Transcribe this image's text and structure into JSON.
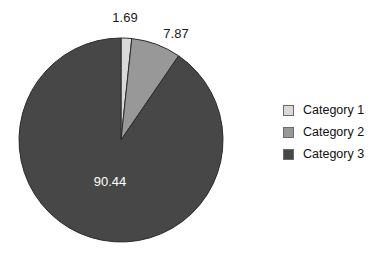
{
  "chart_data": {
    "type": "pie",
    "title": "",
    "categories": [
      "Category 1",
      "Category 2",
      "Category 3"
    ],
    "values": [
      1.69,
      7.87,
      90.44
    ],
    "value_labels": [
      "1.69",
      "7.87",
      "90.44"
    ],
    "colors": [
      "#d9d9d9",
      "#989898",
      "#474747"
    ],
    "start_angle_deg": 0,
    "direction": "clockwise",
    "legend_position": "right",
    "grid": false,
    "units": "percent",
    "label_text_colors": [
      "#1a1a1a",
      "#1a1a1a",
      "#ffffff"
    ]
  },
  "labels": {
    "slice1_value": "1.69",
    "slice2_value": "7.87",
    "slice3_value": "90.44"
  },
  "legend": {
    "items": [
      {
        "label": "Category 1",
        "color": "#d9d9d9"
      },
      {
        "label": "Category 2",
        "color": "#989898"
      },
      {
        "label": "Category 3",
        "color": "#474747"
      }
    ]
  },
  "colors": {
    "background": "#ffffff",
    "outline": "#2b2b2b",
    "text": "#1a1a1a",
    "inverse_text": "#ffffff"
  }
}
